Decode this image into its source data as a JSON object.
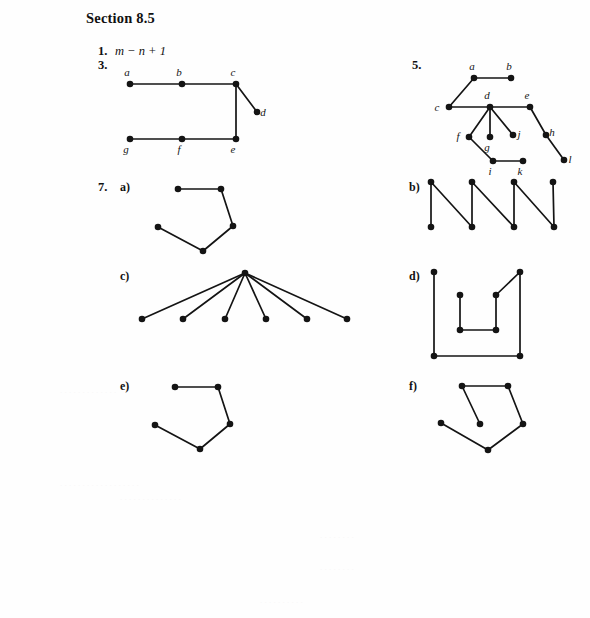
{
  "page": {
    "width": 590,
    "height": 618,
    "background": "#fefefe",
    "ink_color": "#141414",
    "section_title": "Section 8.5"
  },
  "problems": [
    {
      "number": "1.",
      "answer_text": "m − n + 1"
    },
    {
      "number": "3.",
      "answer_text": ""
    },
    {
      "number": "5.",
      "answer_text": ""
    },
    {
      "number": "7.",
      "answer_text": ""
    }
  ],
  "part_labels": {
    "a": "a)",
    "b": "b)",
    "c": "c)",
    "d": "d)",
    "e": "e)",
    "f": "f)"
  },
  "graphs": {
    "problem3": {
      "caption": "labeled tree for exercise 3",
      "width": 160,
      "height": 90,
      "vertices": [
        {
          "id": "a",
          "label": "a",
          "x": 14,
          "y": 22,
          "label_dx": -3,
          "label_dy": -8
        },
        {
          "id": "b",
          "label": "b",
          "x": 66,
          "y": 22,
          "label_dx": -3,
          "label_dy": -8
        },
        {
          "id": "c",
          "label": "c",
          "x": 120,
          "y": 22,
          "label_dx": -3,
          "label_dy": -8
        },
        {
          "id": "d",
          "label": "d",
          "x": 141,
          "y": 50,
          "label_dx": 6,
          "label_dy": 4
        },
        {
          "id": "e",
          "label": "e",
          "x": 120,
          "y": 77,
          "label_dx": -3,
          "label_dy": 14
        },
        {
          "id": "f",
          "label": "f",
          "x": 66,
          "y": 77,
          "label_dx": -3,
          "label_dy": 14
        },
        {
          "id": "g",
          "label": "g",
          "x": 14,
          "y": 77,
          "label_dx": -4,
          "label_dy": 14
        }
      ],
      "edges": [
        [
          "a",
          "b"
        ],
        [
          "b",
          "c"
        ],
        [
          "c",
          "d"
        ],
        [
          "c",
          "e"
        ],
        [
          "e",
          "f"
        ],
        [
          "f",
          "g"
        ]
      ]
    },
    "problem5": {
      "caption": "labeled tree for exercise 5",
      "width": 135,
      "height": 105,
      "vertices": [
        {
          "id": "a",
          "label": "a",
          "x": 36,
          "y": 16,
          "label_dx": -2,
          "label_dy": -8
        },
        {
          "id": "b",
          "label": "b",
          "x": 73,
          "y": 16,
          "label_dx": -2,
          "label_dy": -8
        },
        {
          "id": "c",
          "label": "c",
          "x": 11,
          "y": 45,
          "label_dx": -12,
          "label_dy": 4
        },
        {
          "id": "d",
          "label": "d",
          "x": 52,
          "y": 45,
          "label_dx": -3,
          "label_dy": -8
        },
        {
          "id": "e",
          "label": "e",
          "x": 92,
          "y": 45,
          "label_dx": -3,
          "label_dy": -8
        },
        {
          "id": "f",
          "label": "f",
          "x": 31,
          "y": 75,
          "label_dx": -11,
          "label_dy": 3
        },
        {
          "id": "g",
          "label": "g",
          "x": 52,
          "y": 75,
          "label_dx": -3,
          "label_dy": 14
        },
        {
          "id": "j",
          "label": "j",
          "x": 75,
          "y": 73,
          "label_dx": 6,
          "label_dy": 3
        },
        {
          "id": "h",
          "label": "h",
          "x": 108,
          "y": 73,
          "label_dx": 6,
          "label_dy": 1
        },
        {
          "id": "i",
          "label": "i",
          "x": 55,
          "y": 99,
          "label_dx": -3,
          "label_dy": 14
        },
        {
          "id": "k",
          "label": "k",
          "x": 85,
          "y": 99,
          "label_dx": -3,
          "label_dy": 14
        },
        {
          "id": "l",
          "label": "l",
          "x": 126,
          "y": 98,
          "label_dx": 6,
          "label_dy": 3
        }
      ],
      "edges": [
        [
          "a",
          "b"
        ],
        [
          "a",
          "c"
        ],
        [
          "c",
          "d"
        ],
        [
          "d",
          "e"
        ],
        [
          "d",
          "f"
        ],
        [
          "d",
          "g"
        ],
        [
          "d",
          "j"
        ],
        [
          "e",
          "h"
        ],
        [
          "h",
          "l"
        ],
        [
          "f",
          "i"
        ],
        [
          "i",
          "k"
        ]
      ]
    },
    "problem7a": {
      "caption": "exercise 7 part a graph",
      "width": 110,
      "height": 80,
      "vertices": [
        {
          "id": "v1",
          "label": "",
          "x": 38,
          "y": 11
        },
        {
          "id": "v2",
          "label": "",
          "x": 81,
          "y": 11
        },
        {
          "id": "v3",
          "label": "",
          "x": 93,
          "y": 48
        },
        {
          "id": "v4",
          "label": "",
          "x": 63,
          "y": 73
        },
        {
          "id": "v5",
          "label": "",
          "x": 18,
          "y": 49
        }
      ],
      "edges": [
        [
          "v1",
          "v2"
        ],
        [
          "v2",
          "v3"
        ],
        [
          "v3",
          "v4"
        ],
        [
          "v4",
          "v5"
        ]
      ]
    },
    "problem7b": {
      "caption": "exercise 7 part b zigzag graph",
      "width": 130,
      "height": 52,
      "vertices": [
        {
          "id": "t1",
          "label": "",
          "x": 6,
          "y": 5
        },
        {
          "id": "b1",
          "label": "",
          "x": 6,
          "y": 50
        },
        {
          "id": "t2",
          "label": "",
          "x": 47,
          "y": 5
        },
        {
          "id": "b2",
          "label": "",
          "x": 47,
          "y": 50
        },
        {
          "id": "t3",
          "label": "",
          "x": 89,
          "y": 5
        },
        {
          "id": "b3",
          "label": "",
          "x": 89,
          "y": 50
        },
        {
          "id": "t4",
          "label": "",
          "x": 128,
          "y": 5
        },
        {
          "id": "b4",
          "label": "",
          "x": 129,
          "y": 50
        }
      ],
      "edges": [
        [
          "t1",
          "b1"
        ],
        [
          "t1",
          "b2"
        ],
        [
          "t2",
          "b2"
        ],
        [
          "t2",
          "b3"
        ],
        [
          "t3",
          "b3"
        ],
        [
          "t3",
          "b4"
        ],
        [
          "t4",
          "b4"
        ]
      ]
    },
    "problem7c": {
      "caption": "exercise 7 part c star graph",
      "width": 215,
      "height": 56,
      "vertices": [
        {
          "id": "center",
          "label": "",
          "x": 124,
          "y": 8
        },
        {
          "id": "l1",
          "label": "",
          "x": 21,
          "y": 54
        },
        {
          "id": "l2",
          "label": "",
          "x": 62,
          "y": 54
        },
        {
          "id": "l3",
          "label": "",
          "x": 104,
          "y": 54
        },
        {
          "id": "l4",
          "label": "",
          "x": 145,
          "y": 54
        },
        {
          "id": "l5",
          "label": "",
          "x": 186,
          "y": 54
        },
        {
          "id": "l6",
          "label": "",
          "x": 226,
          "y": 54
        }
      ],
      "edges": [
        [
          "center",
          "l1"
        ],
        [
          "center",
          "l2"
        ],
        [
          "center",
          "l3"
        ],
        [
          "center",
          "l4"
        ],
        [
          "center",
          "l5"
        ],
        [
          "center",
          "l6"
        ]
      ]
    },
    "problem7d": {
      "caption": "exercise 7 part d graph",
      "width": 95,
      "height": 92,
      "vertices": [
        {
          "id": "tl",
          "label": "",
          "x": 6,
          "y": 6
        },
        {
          "id": "bl",
          "label": "",
          "x": 6,
          "y": 90
        },
        {
          "id": "br",
          "label": "",
          "x": 92,
          "y": 90
        },
        {
          "id": "tr",
          "label": "",
          "x": 92,
          "y": 6
        },
        {
          "id": "ir",
          "label": "",
          "x": 68,
          "y": 29
        },
        {
          "id": "irb",
          "label": "",
          "x": 68,
          "y": 64
        },
        {
          "id": "ilb",
          "label": "",
          "x": 32,
          "y": 64
        },
        {
          "id": "il",
          "label": "",
          "x": 32,
          "y": 29
        }
      ],
      "edges": [
        [
          "tl",
          "bl"
        ],
        [
          "bl",
          "br"
        ],
        [
          "br",
          "tr"
        ],
        [
          "tr",
          "ir"
        ],
        [
          "ir",
          "irb"
        ],
        [
          "irb",
          "ilb"
        ],
        [
          "ilb",
          "il"
        ]
      ]
    },
    "problem7e": {
      "caption": "exercise 7 part e graph",
      "width": 110,
      "height": 80,
      "vertices": [
        {
          "id": "v1",
          "label": "",
          "x": 38,
          "y": 11
        },
        {
          "id": "v2",
          "label": "",
          "x": 81,
          "y": 11
        },
        {
          "id": "v3",
          "label": "",
          "x": 93,
          "y": 48
        },
        {
          "id": "v4",
          "label": "",
          "x": 63,
          "y": 73
        },
        {
          "id": "v5",
          "label": "",
          "x": 18,
          "y": 49
        }
      ],
      "edges": [
        [
          "v1",
          "v2"
        ],
        [
          "v2",
          "v3"
        ],
        [
          "v3",
          "v4"
        ],
        [
          "v4",
          "v5"
        ]
      ]
    },
    "problem7f": {
      "caption": "exercise 7 part f graph",
      "width": 110,
      "height": 80,
      "vertices": [
        {
          "id": "v1",
          "label": "",
          "x": 34,
          "y": 10
        },
        {
          "id": "v2",
          "label": "",
          "x": 80,
          "y": 10
        },
        {
          "id": "v3",
          "label": "",
          "x": 95,
          "y": 48
        },
        {
          "id": "v4",
          "label": "",
          "x": 60,
          "y": 74
        },
        {
          "id": "v5",
          "label": "",
          "x": 13,
          "y": 47
        },
        {
          "id": "v6",
          "label": "",
          "x": 52,
          "y": 48
        }
      ],
      "edges": [
        [
          "v1",
          "v2"
        ],
        [
          "v2",
          "v3"
        ],
        [
          "v3",
          "v4"
        ],
        [
          "v4",
          "v5"
        ],
        [
          "v1",
          "v6"
        ]
      ]
    }
  }
}
